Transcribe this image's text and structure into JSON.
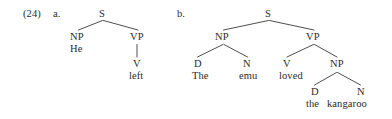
{
  "figure": {
    "example_number": "(24)",
    "items": [
      {
        "letter": "a."
      },
      {
        "letter": "b."
      }
    ]
  },
  "tree_a": {
    "nodes": {
      "s": "S",
      "np": "NP",
      "vp": "VP",
      "v": "V"
    },
    "words": {
      "he": "He",
      "left": "left"
    }
  },
  "tree_b": {
    "nodes": {
      "s": "S",
      "np_subj": "NP",
      "vp": "VP",
      "d_subj": "D",
      "n_subj": "N",
      "v": "V",
      "np_obj": "NP",
      "d_obj": "D",
      "n_obj": "N"
    },
    "words": {
      "the_subj": "The",
      "emu": "emu",
      "loved": "loved",
      "the_obj": "the",
      "kangaroo": "kangaroo"
    }
  },
  "style": {
    "ink": "#2b2b2b",
    "branch": "#3a3a3a",
    "background": "#ffffff"
  }
}
